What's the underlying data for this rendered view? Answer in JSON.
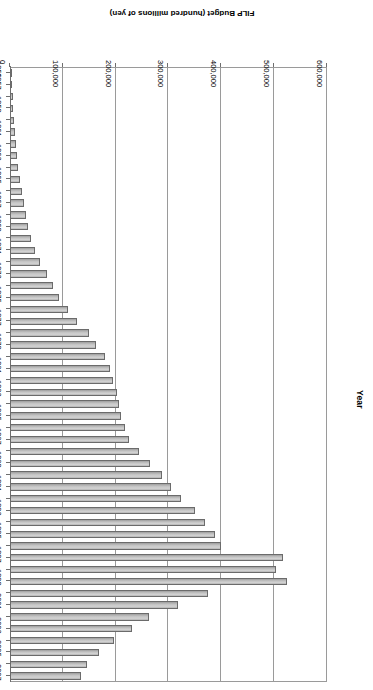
{
  "chart_data": {
    "type": "bar",
    "orientation": "horizontal",
    "title": "",
    "xlabel": "FILP Budget (hundred millions of yen)",
    "ylabel": "Year",
    "xlim": [
      0,
      600000
    ],
    "grid": true,
    "legend": "none",
    "rotation": "180",
    "x_tick_labels": [
      "0",
      "100,000",
      "200,000",
      "300,000",
      "400,000",
      "500,000",
      "600,000"
    ],
    "x_ticks": [
      0,
      100000,
      200000,
      300000,
      400000,
      500000,
      600000
    ],
    "category_tick_labels": [
      "1956",
      "1957",
      "1959",
      "1961",
      "1963",
      "1965",
      "1967",
      "1969",
      "1971",
      "1973",
      "1975",
      "1977",
      "1979",
      "1981",
      "1983",
      "1985",
      "1987",
      "1989",
      "1991",
      "1993",
      "1995",
      "1997",
      "1999",
      "2001",
      "2003",
      "2005",
      "2007"
    ],
    "categories": [
      "1956",
      "1957",
      "1958",
      "1959",
      "1960",
      "1961",
      "1962",
      "1963",
      "1964",
      "1965",
      "1966",
      "1967",
      "1968",
      "1969",
      "1970",
      "1971",
      "1972",
      "1973",
      "1974",
      "1975",
      "1976",
      "1977",
      "1978",
      "1979",
      "1980",
      "1981",
      "1982",
      "1983",
      "1984",
      "1985",
      "1986",
      "1987",
      "1988",
      "1989",
      "1990",
      "1991",
      "1992",
      "1993",
      "1994",
      "1995",
      "1996",
      "1997",
      "1998",
      "1999",
      "2000",
      "2001",
      "2002",
      "2003",
      "2004",
      "2005",
      "2006",
      "2007"
    ],
    "values": [
      3200,
      4100,
      4900,
      5900,
      7300,
      9100,
      11100,
      13300,
      16100,
      18400,
      21800,
      25700,
      29800,
      34200,
      39500,
      47500,
      57700,
      70700,
      81800,
      93000,
      110500,
      127600,
      149100,
      162300,
      180500,
      188400,
      195900,
      202400,
      206000,
      209200,
      217300,
      225800,
      245100,
      265700,
      287500,
      304300,
      323600,
      351000,
      368800,
      388000,
      400200,
      517000,
      503100,
      524600,
      375000,
      318600,
      262800,
      231000,
      197000,
      168000,
      146000,
      134000
    ],
    "bar_color": "#c8c8c8",
    "bar_edge_color": "#6b6b6b",
    "axis_color": "#9a9a9a",
    "text_color": "#000000"
  }
}
